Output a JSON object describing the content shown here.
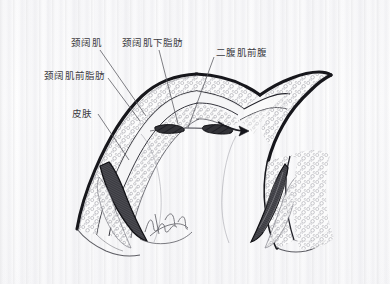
{
  "figure": {
    "kind": "anatomical-cross-section-illustration",
    "background_color": "#fdfdfd",
    "ink_color": "#1c1c20",
    "leader_line_color": "#55555c",
    "label_text_color": "#3a3a40",
    "signature": "illegible cursive artist signature"
  },
  "labels": [
    {
      "id": "platysma",
      "text": "颈阔肌",
      "x": 71,
      "y": 37,
      "leader": {
        "x1": 100,
        "y1": 50,
        "x2": 146,
        "y2": 116
      }
    },
    {
      "id": "subplatysmal-fat",
      "text": "颈阔肌下脂肪",
      "x": 122,
      "y": 37,
      "leader": {
        "x1": 159,
        "y1": 50,
        "x2": 178,
        "y2": 124
      }
    },
    {
      "id": "anterior-belly-digastric",
      "text": "二腹肌前腹",
      "x": 216,
      "y": 47,
      "leader": {
        "x1": 214,
        "y1": 57,
        "x2": 188,
        "y2": 128
      }
    },
    {
      "id": "preplatysmal-fat",
      "text": "颈阔肌前脂肪",
      "x": 44,
      "y": 70,
      "leader": {
        "x1": 108,
        "y1": 78,
        "x2": 140,
        "y2": 121
      }
    },
    {
      "id": "skin",
      "text": "皮肤",
      "x": 72,
      "y": 108,
      "leader": {
        "x1": 98,
        "y1": 114,
        "x2": 129,
        "y2": 160
      }
    }
  ],
  "annotations": {
    "retraction_arrow": {
      "id": "flap-retraction-arrow",
      "description": "arrow indicating direction of flap retraction on right side",
      "tip_x": 247,
      "tip_y": 130
    }
  }
}
